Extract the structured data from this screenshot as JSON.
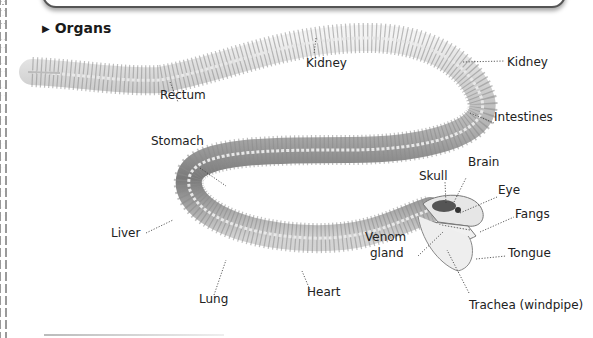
{
  "section": {
    "title": "Organs",
    "marker_icon": "triangle-right"
  },
  "labels": {
    "rectum": "Rectum",
    "kidney_1": "Kidney",
    "kidney_2": "Kidney",
    "intestines": "Intestines",
    "stomach": "Stomach",
    "brain": "Brain",
    "skull": "Skull",
    "eye": "Eye",
    "fangs": "Fangs",
    "liver": "Liver",
    "venom_gland_1": "Venom",
    "venom_gland_2": "gland",
    "tongue": "Tongue",
    "heart": "Heart",
    "lung": "Lung",
    "trachea": "Trachea (windpipe)"
  },
  "colors": {
    "bone": "#d9d9d9",
    "body_dark": "#6e6e6e",
    "leader": "#333333"
  }
}
